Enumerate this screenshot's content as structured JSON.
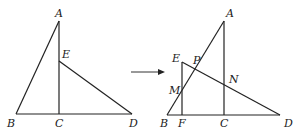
{
  "figure_left": {
    "points": {
      "A": "A",
      "B": "B",
      "C": "C",
      "D": "D",
      "E": "E"
    }
  },
  "figure_right": {
    "points": {
      "A": "A",
      "B": "B",
      "C": "C",
      "D": "D",
      "E": "E",
      "F": "F",
      "M": "M",
      "N": "N",
      "P": "P"
    }
  },
  "arrow": {
    "direction": "right"
  },
  "colors": {
    "stroke": "#222222",
    "background": "#ffffff"
  }
}
